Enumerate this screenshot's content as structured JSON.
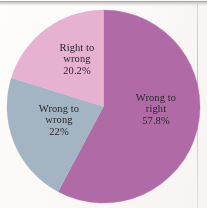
{
  "chart_data": {
    "type": "pie",
    "title": "",
    "subtitle": "",
    "xlabel": "",
    "ylabel": "",
    "legend_position": "none",
    "grid": false,
    "labels_inside_slices": true,
    "start_angle_deg": 0,
    "direction": "clockwise",
    "categories": [
      "Wrong to right",
      "Wrong to wrong",
      "Right to wrong"
    ],
    "values": [
      57.8,
      22.0,
      20.2
    ],
    "value_suffix": "%",
    "slices": [
      {
        "name": "wrong-to-right",
        "line1": "Wrong to",
        "line2": "right",
        "value_text": "57.8%",
        "value": 57.8,
        "color": "#b06ba6",
        "start_deg": 0,
        "end_deg": 208.08
      },
      {
        "name": "wrong-to-wrong",
        "line1": "Wrong to",
        "line2": "wrong",
        "value_text": "22%",
        "value": 22.0,
        "color": "#a3b5c2",
        "start_deg": 208.08,
        "end_deg": 287.28
      },
      {
        "name": "right-to-wrong",
        "line1": "Right to",
        "line2": "wrong",
        "value_text": "20.2%",
        "value": 20.2,
        "color": "#e7b2d2",
        "start_deg": 287.28,
        "end_deg": 360
      }
    ],
    "colors": {
      "wrong_to_right": "#b06ba6",
      "wrong_to_wrong": "#a3b5c2",
      "right_to_wrong": "#e7b2d2",
      "label_text": "#241c22",
      "background": "#fdfbf9"
    }
  }
}
